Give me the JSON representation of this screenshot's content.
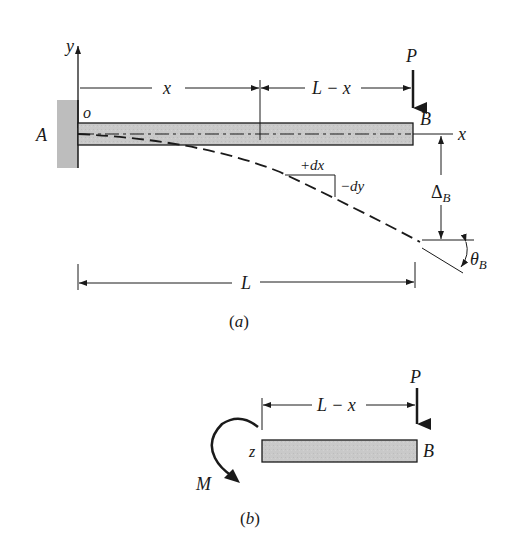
{
  "figure_a": {
    "support_label": "A",
    "origin_label": "o",
    "y_axis_label": "y",
    "x_axis_label": "x",
    "load_label": "P",
    "free_end_label": "B",
    "dim_x_label": "x",
    "dim_L_minus_x_label": "L − x",
    "dim_L_label": "L",
    "increment_dx_label": "+dx",
    "increment_dy_label": "−dy",
    "deflection_label": "Δ",
    "deflection_subscript": "B",
    "slope_label": "θ",
    "slope_subscript": "B",
    "caption": "(a)"
  },
  "figure_b": {
    "load_label": "P",
    "dim_L_minus_x_label": "L − x",
    "section_label": "z",
    "free_end_label": "B",
    "moment_label": "M",
    "caption": "(b)"
  },
  "colors": {
    "beam_fill": "#c9c9c9",
    "wall_fill": "#bdbdbd",
    "line": "#1a1a1a"
  }
}
